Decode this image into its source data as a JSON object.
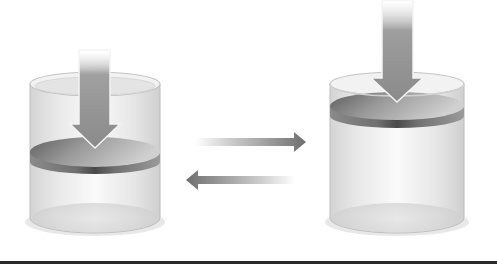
{
  "diagram": {
    "title": "",
    "colors": {
      "background": "#ffffff",
      "cylinder_glass": "#e6e6e6",
      "cylinder_edge": "#b5b5b5",
      "piston_top": "#8a8a8a",
      "piston_side": "#6e6e6e",
      "arrow": "#8c8c8c",
      "bottom_bar": "#2a2a2a"
    },
    "left_cylinder": {
      "label": "",
      "piston_position": "middle",
      "force_arrow": "down-icon"
    },
    "right_cylinder": {
      "label": "",
      "piston_position": "top",
      "force_arrow": "down-icon"
    },
    "equilibrium_arrows": [
      {
        "direction": "right",
        "icon": "arrow-right-icon"
      },
      {
        "direction": "left",
        "icon": "arrow-left-icon"
      }
    ]
  }
}
